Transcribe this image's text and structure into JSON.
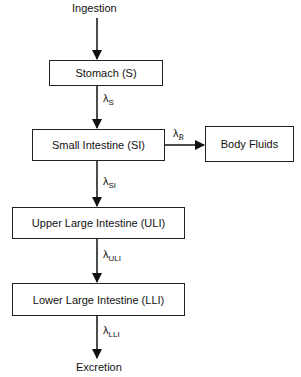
{
  "diagram": {
    "input": "Ingestion",
    "output": "Excretion",
    "nodes": {
      "stomach": "Stomach (S)",
      "small_intestine": "Small Intestine (SI)",
      "body_fluids": "Body Fluids",
      "upper_large_intestine": "Upper Large Intestine (ULI)",
      "lower_large_intestine": "Lower Large Intestine (LLI)"
    },
    "rates": {
      "stomach": {
        "symbol": "λ",
        "sub": "S"
      },
      "body": {
        "symbol": "λ",
        "sub": "B"
      },
      "small_intestine": {
        "symbol": "λ",
        "sub": "SI"
      },
      "upper_large_intestine": {
        "symbol": "λ",
        "sub": "ULI"
      },
      "lower_large_intestine": {
        "symbol": "λ",
        "sub": "LLI"
      }
    }
  }
}
